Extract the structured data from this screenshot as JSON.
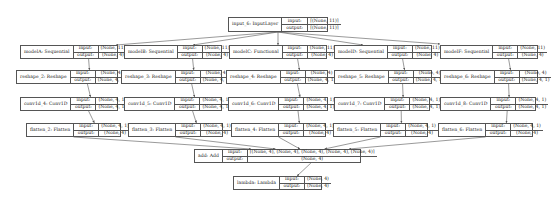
{
  "diagram": {
    "type": "keras-model-plot",
    "io_labels": {
      "input": "input:",
      "output": "output:"
    },
    "nodes": [
      {
        "id": "input_6",
        "name": "input_6: InputLayer",
        "input": "[(None, 11)]",
        "output": "[(None, 11)]",
        "box": [
          228,
          17,
          100,
          15
        ],
        "nameW": 51,
        "lblW": 21
      },
      {
        "id": "modelA",
        "name": "modelA: Sequential",
        "input": "(None, 11)",
        "output": "(None, 4)",
        "box": [
          20,
          45,
          98,
          14
        ],
        "nameW": 49,
        "lblW": 20
      },
      {
        "id": "modelB",
        "name": "modelB: Sequential",
        "input": "(None, 11)",
        "output": "(None, 4)",
        "box": [
          124,
          45,
          98,
          14
        ],
        "nameW": 49,
        "lblW": 20
      },
      {
        "id": "modelC",
        "name": "modelC: Functional",
        "input": "(None, 11)",
        "output": "(None, 4)",
        "box": [
          229,
          45,
          98,
          14
        ],
        "nameW": 49,
        "lblW": 20
      },
      {
        "id": "modelD",
        "name": "modelD: Sequential",
        "input": "(None, 11)",
        "output": "(None, 4)",
        "box": [
          334,
          45,
          98,
          14
        ],
        "nameW": 49,
        "lblW": 20
      },
      {
        "id": "modelF",
        "name": "modelF: Sequential",
        "input": "(None, 11)",
        "output": "(None, 4)",
        "box": [
          440,
          45,
          98,
          14
        ],
        "nameW": 49,
        "lblW": 20
      },
      {
        "id": "reshape_2",
        "name": "reshape_2: Reshape",
        "input": "(None, 4)",
        "output": "(None, 4, 1)",
        "box": [
          16,
          70,
          102,
          14
        ],
        "nameW": 51,
        "lblW": 20
      },
      {
        "id": "reshape_3",
        "name": "reshape_3: Reshape",
        "input": "(None, 4)",
        "output": "(None, 4, 1)",
        "box": [
          121,
          70,
          101,
          14
        ],
        "nameW": 50,
        "lblW": 20
      },
      {
        "id": "reshape_4",
        "name": "reshape_4: Reshape",
        "input": "(None, 4)",
        "output": "(None, 4, 1)",
        "box": [
          226,
          70,
          102,
          14
        ],
        "nameW": 51,
        "lblW": 20
      },
      {
        "id": "reshape_5",
        "name": "reshape_5: Reshape",
        "input": "(None, 4)",
        "output": "(None, 4, 1)",
        "box": [
          334,
          70,
          98,
          14
        ],
        "nameW": 48,
        "lblW": 20
      },
      {
        "id": "reshape_6",
        "name": "reshape_6: Reshape",
        "input": "(None, 4)",
        "output": "(None, 4, 1)",
        "box": [
          440,
          70,
          98,
          14
        ],
        "nameW": 48,
        "lblW": 20
      },
      {
        "id": "conv1d_4",
        "name": "conv1d_4: Conv1D",
        "input": "(None, 4, 1)",
        "output": "(None, 4, 1)",
        "box": [
          20,
          97,
          98,
          14
        ],
        "nameW": 47,
        "lblW": 20
      },
      {
        "id": "conv1d_5",
        "name": "conv1d_5: Conv1D",
        "input": "(None, 4, 1)",
        "output": "(None, 4, 1)",
        "box": [
          124,
          97,
          98,
          14
        ],
        "nameW": 47,
        "lblW": 20
      },
      {
        "id": "conv1d_6",
        "name": "conv1d_6: Conv1D",
        "input": "(None, 4, 1)",
        "output": "(None, 4, 1)",
        "box": [
          228,
          97,
          100,
          14
        ],
        "nameW": 49,
        "lblW": 20
      },
      {
        "id": "conv1d_7",
        "name": "conv1d_7: Conv1D",
        "input": "(None, 4, 1)",
        "output": "(None, 4, 1)",
        "box": [
          334,
          97,
          96,
          14
        ],
        "nameW": 45,
        "lblW": 20
      },
      {
        "id": "conv1d_8",
        "name": "conv1d_8: Conv1D",
        "input": "(None, 4, 1)",
        "output": "(None, 4, 1)",
        "box": [
          440,
          97,
          96,
          14
        ],
        "nameW": 45,
        "lblW": 20
      },
      {
        "id": "flatten_2",
        "name": "flatten_2: Flatten",
        "input": "(None, 4, 1)",
        "output": "(None, 4)",
        "box": [
          26,
          123,
          95,
          14
        ],
        "nameW": 44,
        "lblW": 20
      },
      {
        "id": "flatten_3",
        "name": "flatten_3: Flatten",
        "input": "(None, 4, 1)",
        "output": "(None, 4)",
        "box": [
          128,
          123,
          95,
          14
        ],
        "nameW": 44,
        "lblW": 20
      },
      {
        "id": "flatten_4",
        "name": "flatten_4: Flatten",
        "input": "(None, 4, 1)",
        "output": "(None, 4)",
        "box": [
          231,
          123,
          95,
          14
        ],
        "nameW": 44,
        "lblW": 20
      },
      {
        "id": "flatten_5",
        "name": "flatten_5: Flatten",
        "input": "(None, 4, 1)",
        "output": "(None, 4)",
        "box": [
          333,
          123,
          95,
          14
        ],
        "nameW": 44,
        "lblW": 20
      },
      {
        "id": "flatten_6",
        "name": "flatten_6: Flatten",
        "input": "(None, 4, 1)",
        "output": "(None, 4)",
        "box": [
          438,
          123,
          95,
          14
        ],
        "nameW": 44,
        "lblW": 20
      },
      {
        "id": "add",
        "name": "add: Add",
        "input": "[(None, 4), (None, 4), (None, 4), (None, 4), (None, 4)]",
        "output": "(None, 4)",
        "box": [
          194,
          149,
          167,
          14
        ],
        "nameW": 25,
        "lblW": 20
      },
      {
        "id": "lambda",
        "name": "lambda: Lambda",
        "input": "(None, 4)",
        "output": "(None, 4)",
        "box": [
          233,
          176,
          89,
          14
        ],
        "nameW": 42,
        "lblW": 20
      }
    ],
    "edges": [
      [
        "input_6",
        "modelA"
      ],
      [
        "input_6",
        "modelB"
      ],
      [
        "input_6",
        "modelC"
      ],
      [
        "input_6",
        "modelD"
      ],
      [
        "input_6",
        "modelF"
      ],
      [
        "modelA",
        "reshape_2"
      ],
      [
        "modelB",
        "reshape_3"
      ],
      [
        "modelC",
        "reshape_4"
      ],
      [
        "modelD",
        "reshape_5"
      ],
      [
        "modelF",
        "reshape_6"
      ],
      [
        "reshape_2",
        "conv1d_4"
      ],
      [
        "reshape_3",
        "conv1d_5"
      ],
      [
        "reshape_4",
        "conv1d_6"
      ],
      [
        "reshape_5",
        "conv1d_7"
      ],
      [
        "reshape_6",
        "conv1d_8"
      ],
      [
        "conv1d_4",
        "flatten_2"
      ],
      [
        "conv1d_5",
        "flatten_3"
      ],
      [
        "conv1d_6",
        "flatten_4"
      ],
      [
        "conv1d_7",
        "flatten_5"
      ],
      [
        "conv1d_8",
        "flatten_6"
      ],
      [
        "flatten_2",
        "add"
      ],
      [
        "flatten_3",
        "add"
      ],
      [
        "flatten_4",
        "add"
      ],
      [
        "flatten_5",
        "add"
      ],
      [
        "flatten_6",
        "add"
      ],
      [
        "add",
        "lambda"
      ]
    ],
    "colors": {
      "line": "#555555",
      "background": "#ffffff",
      "text": "#222222"
    }
  }
}
